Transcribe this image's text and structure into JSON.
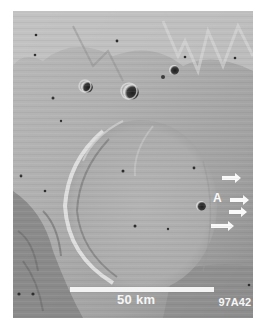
{
  "figure": {
    "scale_bar": {
      "label": "50 km"
    },
    "image_id": "97A42",
    "annotations": {
      "label": "A",
      "arrow_count": 4
    }
  },
  "colors": {
    "background": "#ffffff",
    "surface_mid": "#a9a9a9",
    "surface_light": "#c8c8c8",
    "surface_dark": "#7c7c7c",
    "annotation": "#f6f6f6"
  }
}
